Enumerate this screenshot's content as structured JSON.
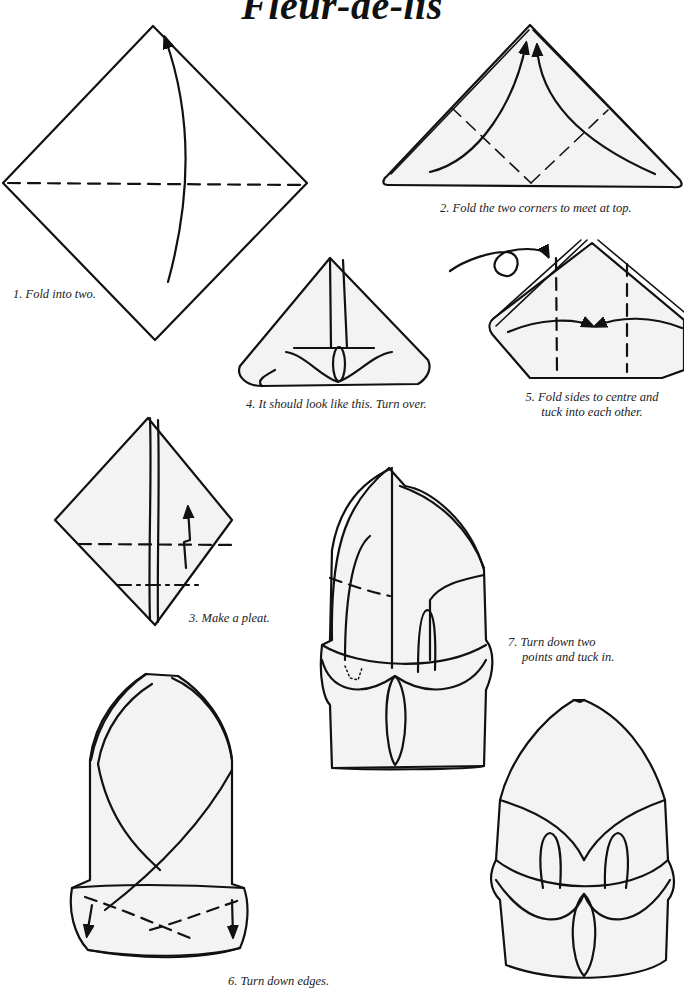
{
  "title": "Fleur-de-lis",
  "steps": [
    {
      "number": 1,
      "caption": "1. Fold into two."
    },
    {
      "number": 2,
      "caption": "2. Fold the two corners to meet at top."
    },
    {
      "number": 3,
      "caption": "3. Make a pleat."
    },
    {
      "number": 4,
      "caption": "4. It should look like this.  Turn over."
    },
    {
      "number": 5,
      "caption_line1": "5. Fold sides to centre and",
      "caption_line2": "tuck into each other."
    },
    {
      "number": 6,
      "caption": "6. Turn down edges."
    },
    {
      "number": 7,
      "caption_line1": "7. Turn down two",
      "caption_line2": "points and tuck in."
    }
  ],
  "icons": {
    "turn_over": "turn-over-loop-arrow",
    "fold_arrow": "curved-arrow",
    "fold_line": "dashed-line"
  },
  "colors": {
    "ink": "#111111",
    "paper": "#ffffff",
    "napkin_fill": "#f3f3f3"
  }
}
